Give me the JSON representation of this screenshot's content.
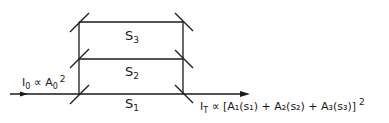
{
  "diagram": {
    "type": "three-path interferometer",
    "paths": [
      {
        "id": "s1",
        "label": "S",
        "sub": "1"
      },
      {
        "id": "s2",
        "label": "S",
        "sub": "2"
      },
      {
        "id": "s3",
        "label": "S",
        "sub": "3"
      }
    ],
    "input_label": {
      "I": "I",
      "I_sub": "0",
      "prop": " ∝ ",
      "A": "A",
      "A_sub": "0",
      "exp": "2"
    },
    "output_label": {
      "I": "I",
      "I_sub": "T",
      "prop": " ∝ ",
      "expr": "[A₁(s₁) + A₂(s₂) + A₃(s₃)]",
      "exp": "2"
    },
    "colors": {
      "line": "#1a1a1a",
      "background": "#ffffff"
    }
  }
}
